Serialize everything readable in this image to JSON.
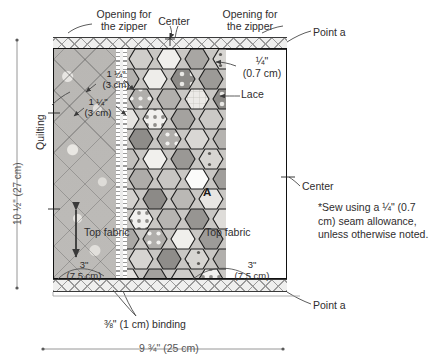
{
  "diagram": {
    "block": {
      "left_panel_label": "Top fabric",
      "right_panel_label": "Top fabric",
      "lace_label": "Lace",
      "center_patch_marker": "A"
    },
    "labels": {
      "opening_left": "Opening for\nthe zipper",
      "center_top": "Center",
      "opening_right": "Opening for\nthe zipper",
      "point_a_top": "Point a",
      "point_a_bottom": "Point a",
      "center_right": "Center",
      "quilting": "Quilting",
      "seam_lace": "¼\"\n(0.7 cm)",
      "quilt_spacing_1": "1 ¼\"\n(3 cm)",
      "quilt_spacing_2": "1 ¼\"\n(3 cm)",
      "bottom_left_width": "3\"\n(7.5 cm)",
      "bottom_right_width": "3\"\n(7.5 cm)",
      "binding": "⅜\" (1 cm) binding",
      "height_dimension": "10 ½\" (27 cm)",
      "width_dimension": "9 ¾\" (25 cm)",
      "note": "*Sew using a ¼\"\n(0.7 cm) seam\nallowance, unless\notherwise noted."
    },
    "colors": {
      "ink": "#2f2d2e",
      "outline": "#111111",
      "fabric_gray": "#b9b7b4",
      "binding_light": "#efefee"
    }
  }
}
